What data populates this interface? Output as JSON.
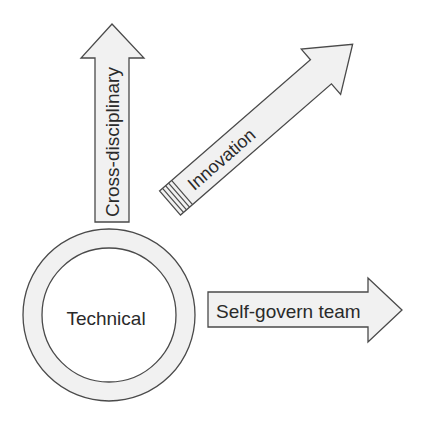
{
  "diagram": {
    "center": {
      "label": "Technical"
    },
    "arrows": [
      {
        "id": "cross-disciplinary",
        "label": "Cross-disciplinary",
        "direction": "up"
      },
      {
        "id": "innovation",
        "label": "Innovation",
        "direction": "up-right"
      },
      {
        "id": "self-govern-team",
        "label": "Self-govern team",
        "direction": "right"
      }
    ],
    "colors": {
      "fill": "#f1f1f1",
      "stroke": "#4a4a4a",
      "text": "#2a2a2a"
    }
  }
}
